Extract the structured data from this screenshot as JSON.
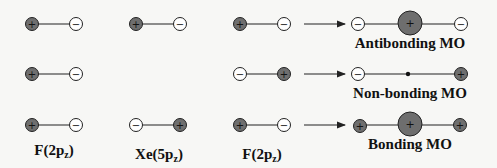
{
  "colors": {
    "background": "#f7f7f5",
    "positive_lobe": "#6e6e6e",
    "negative_lobe": "#ffffff",
    "stroke": "#222222"
  },
  "signs": {
    "plus": "+",
    "minus": "−"
  },
  "atom_labels": {
    "f_left": "F(2p",
    "xe": "Xe(5p",
    "f_right": "F(2p",
    "subscript": "z",
    "close": ")"
  },
  "mo_labels": {
    "antibonding": "Antibonding MO",
    "nonbonding": "Non-bonding MO",
    "bonding": "Bonding MO"
  },
  "rows": [
    {
      "name": "antibonding",
      "f_left": [
        "+",
        "-"
      ],
      "xe": [
        "+",
        "-"
      ],
      "f_right": [
        "+",
        "-"
      ],
      "result": [
        "-",
        "big+",
        "-"
      ]
    },
    {
      "name": "nonbonding",
      "f_left": [
        "+",
        "-"
      ],
      "xe": [],
      "f_right": [
        "-",
        "+"
      ],
      "result": [
        "-",
        "node",
        "+"
      ]
    },
    {
      "name": "bonding",
      "f_left": [
        "+",
        "-"
      ],
      "xe": [
        "-",
        "+"
      ],
      "f_right": [
        "+",
        "-"
      ],
      "result": [
        "+",
        "big+",
        "+"
      ]
    }
  ]
}
